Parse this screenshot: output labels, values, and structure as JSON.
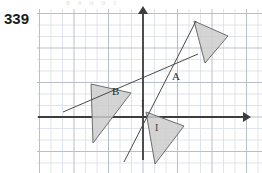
{
  "figure": {
    "number": "339",
    "top_cut_text": "в а о о с",
    "background": "#ffffff"
  },
  "grid": {
    "left": 37,
    "top": 9,
    "right": 262,
    "bottom": 173,
    "spacing": 11.5,
    "minor_color": "#d8dde6",
    "major_color": "#b9bfc9",
    "major_every": 3
  },
  "axes": {
    "color": "#3d3d3d",
    "origin_x": 143,
    "origin_y": 117,
    "x_axis": {
      "x1": 38,
      "y1": 117,
      "x2": 243,
      "y2": 117,
      "arrow": "right"
    },
    "y_axis": {
      "x1": 143,
      "y1": 160,
      "x2": 143,
      "y2": 14,
      "arrow": "up"
    }
  },
  "lines": [
    {
      "name": "steep-line",
      "x1": 124,
      "y1": 162,
      "x2": 196,
      "y2": 21,
      "color": "#4a4a4a",
      "width": 1
    },
    {
      "name": "shallow-line",
      "x1": 63,
      "y1": 112,
      "x2": 198,
      "y2": 54,
      "color": "#4a4a4a",
      "width": 1
    }
  ],
  "triangles": [
    {
      "name": "upper-right-triangle",
      "points": "194,21 228,36 205,63",
      "fill": "#cdcdcd",
      "stroke": "#6d6d6d"
    },
    {
      "name": "left-triangle",
      "points": "91,84 131,93 93,143",
      "fill": "#cdcdcd",
      "stroke": "#6d6d6d"
    },
    {
      "name": "lower-right-triangle",
      "points": "146,112 184,126 155,164",
      "fill": "#cdcdcd",
      "stroke": "#6d6d6d"
    }
  ],
  "labels": [
    {
      "name": "point-label-a",
      "text": "A",
      "x": 172,
      "y": 80
    },
    {
      "name": "point-label-b",
      "text": "B",
      "x": 112,
      "y": 95
    },
    {
      "name": "tick-label-left",
      "text": "I",
      "x": 141,
      "y": 107
    },
    {
      "name": "tick-label-right",
      "text": "I",
      "x": 155,
      "y": 131
    }
  ]
}
